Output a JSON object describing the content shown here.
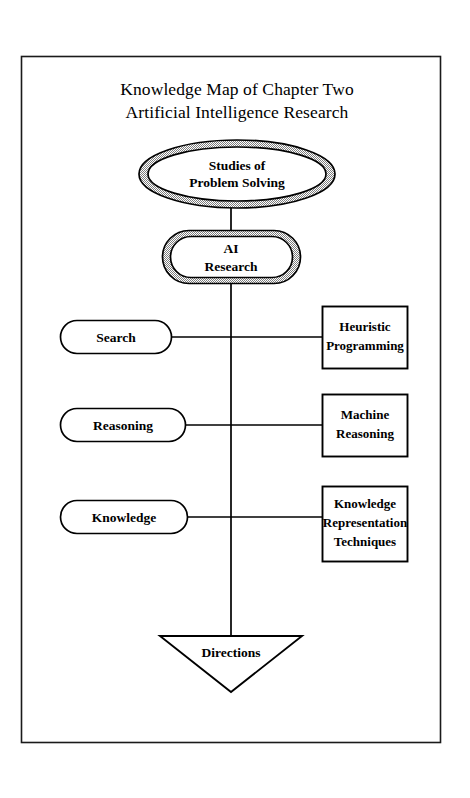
{
  "page": {
    "background_color": "#ffffff",
    "frame_color": "#1a1a1a"
  },
  "title": {
    "line1": "Knowledge Map of Chapter Two",
    "line2": "Artificial Intelligence Research"
  },
  "nodes": {
    "root": {
      "shape": "double-ellipse",
      "line1": "Studies of",
      "line2": "Problem Solving"
    },
    "main": {
      "shape": "double-rounded-rect",
      "line1": "AI",
      "line2": "Research"
    },
    "branches": [
      {
        "shape": "pill",
        "label": "Search",
        "target_shape": "rect",
        "target_line1": "Heuristic",
        "target_line2": "Programming",
        "target_line3": ""
      },
      {
        "shape": "pill",
        "label": "Reasoning",
        "target_shape": "rect",
        "target_line1": "Machine",
        "target_line2": "Reasoning",
        "target_line3": ""
      },
      {
        "shape": "pill",
        "label": "Knowledge",
        "target_shape": "rect",
        "target_line1": "Knowledge",
        "target_line2": "Representation",
        "target_line3": "Techniques"
      }
    ],
    "terminal": {
      "shape": "inverted-triangle",
      "label": "Directions"
    }
  },
  "colors": {
    "stroke": "#000000",
    "ring_fill": "#b8b8b8",
    "node_fill": "#ffffff",
    "text": "#000000"
  }
}
